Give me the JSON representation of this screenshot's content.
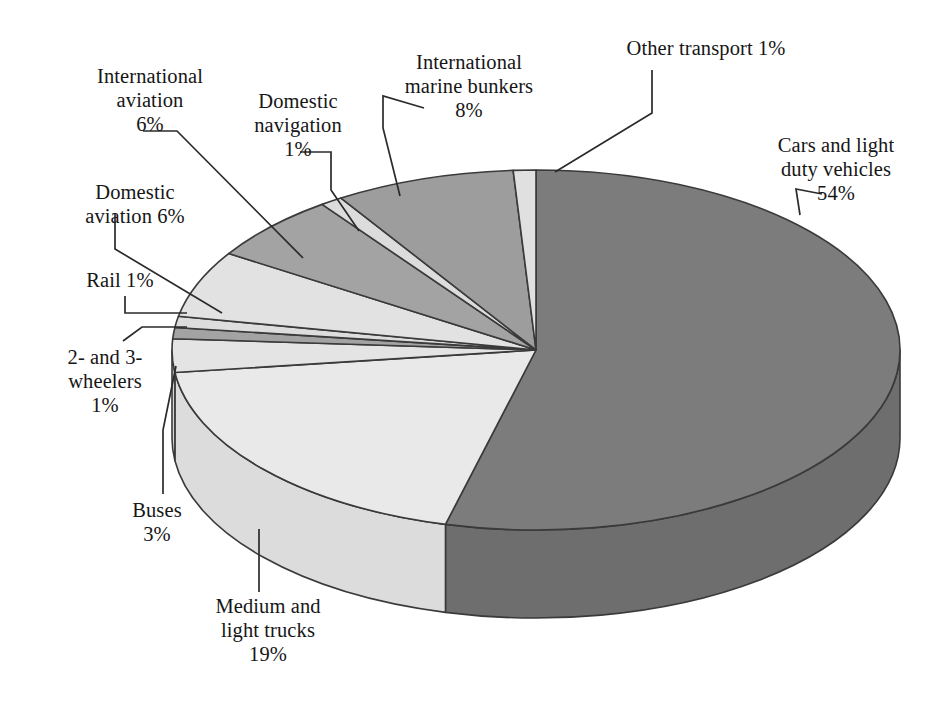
{
  "chart_data": {
    "type": "pie",
    "title": "",
    "subtitle": "",
    "style": "3d-exploded-none",
    "unit": "%",
    "legend_position": "callout-labels",
    "grid": false,
    "start_angle_deg": 0,
    "direction": "clockwise",
    "categories": [
      "Cars and light duty vehicles",
      "Medium and light trucks",
      "Buses",
      "2- and 3-wheelers",
      "Rail",
      "Domestic aviation",
      "International aviation",
      "Domestic navigation",
      "International marine bunkers",
      "Other transport"
    ],
    "values": [
      54,
      19,
      3,
      1,
      1,
      6,
      6,
      1,
      8,
      1
    ],
    "slices": [
      {
        "id": "cars",
        "name": "Cars and light duty vehicles",
        "value": 54,
        "label": "Cars and light\nduty vehicles\n54%",
        "percent_text": "54%",
        "color": "#7c7c7c",
        "side_color": "#6e6e6e"
      },
      {
        "id": "medium-light-trucks",
        "name": "Medium and light trucks",
        "value": 19,
        "label": "Medium and\nlight trucks\n19%",
        "percent_text": "19%",
        "color": "#e9e9e9",
        "side_color": "#dcdcdc"
      },
      {
        "id": "buses",
        "name": "Buses",
        "value": 3,
        "label": "Buses\n3%",
        "percent_text": "3%",
        "color": "#e4e4e4",
        "side_color": "#d7d7d7"
      },
      {
        "id": "two-three-wheelers",
        "name": "2- and 3-wheelers",
        "value": 1,
        "label": "2- and 3-\nwheelers\n1%",
        "percent_text": "1%",
        "color": "#a3a3a3",
        "side_color": "#949494"
      },
      {
        "id": "rail",
        "name": "Rail",
        "value": 1,
        "label": "Rail 1%",
        "percent_text": "1%",
        "color": "#dddddd",
        "side_color": "#cfcfcf"
      },
      {
        "id": "domestic-aviation",
        "name": "Domestic aviation",
        "value": 6,
        "label": "Domestic\naviation 6%",
        "percent_text": "6%",
        "color": "#e2e2e2",
        "side_color": "#d4d4d4"
      },
      {
        "id": "international-aviation",
        "name": "International aviation",
        "value": 6,
        "label": "International\naviation\n6%",
        "percent_text": "6%",
        "color": "#a3a3a3",
        "side_color": "#949494"
      },
      {
        "id": "domestic-navigation",
        "name": "Domestic navigation",
        "value": 1,
        "label": "Domestic\nnavigation\n1%",
        "percent_text": "1%",
        "color": "#dcdcdc",
        "side_color": "#cecece"
      },
      {
        "id": "marine-bunkers",
        "name": "International marine bunkers",
        "value": 8,
        "label": "International\nmarine bunkers\n8%",
        "percent_text": "8%",
        "color": "#9d9d9d",
        "side_color": "#8e8e8e"
      },
      {
        "id": "other-transport",
        "name": "Other transport",
        "value": 1,
        "label": "Other transport 1%",
        "percent_text": "1%",
        "color": "#e0e0e0",
        "side_color": "#d2d2d2"
      }
    ],
    "colors": {
      "outline": "#3a3a3a",
      "leader_line": "#2b2b2b",
      "background": "#ffffff",
      "text": "#161616"
    }
  },
  "geometry": {
    "center_x": 536,
    "center_y": 350,
    "radius_x": 364,
    "radius_y": 180,
    "depth": 88
  }
}
